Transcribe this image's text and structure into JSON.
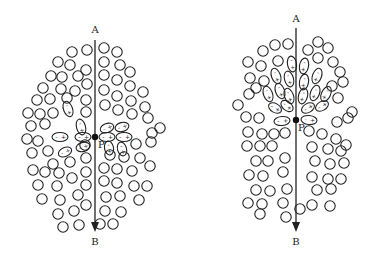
{
  "diagrams": [
    {
      "id": "left",
      "description": "Molecules polarized horizontally near point P on line AB",
      "axis": {
        "x": 95,
        "top_y": 40,
        "bottom_y": 232,
        "top_label": "A",
        "bottom_label": "B",
        "label_top_y": 33,
        "label_bottom_y": 245
      },
      "point": {
        "x": 95,
        "y": 137,
        "label": "P",
        "label_x": 98,
        "label_y": 148
      },
      "circles": [
        [
          72,
          52
        ],
        [
          87,
          50
        ],
        [
          58,
          62
        ],
        [
          70,
          65
        ],
        [
          86,
          70
        ],
        [
          51,
          76
        ],
        [
          62,
          77
        ],
        [
          78,
          76
        ],
        [
          87,
          84
        ],
        [
          43,
          88
        ],
        [
          61,
          89
        ],
        [
          75,
          91
        ],
        [
          37,
          100
        ],
        [
          50,
          99
        ],
        [
          67,
          98
        ],
        [
          86,
          100
        ],
        [
          28,
          113
        ],
        [
          40,
          114
        ],
        [
          53,
          113
        ],
        [
          86,
          112
        ],
        [
          31,
          126
        ],
        [
          45,
          124
        ],
        [
          27,
          139
        ],
        [
          38,
          141
        ],
        [
          32,
          153
        ],
        [
          48,
          151
        ],
        [
          53,
          164
        ],
        [
          33,
          170
        ],
        [
          45,
          172
        ],
        [
          59,
          173
        ],
        [
          70,
          162
        ],
        [
          38,
          185
        ],
        [
          57,
          186
        ],
        [
          72,
          178
        ],
        [
          42,
          199
        ],
        [
          60,
          200
        ],
        [
          78,
          195
        ],
        [
          58,
          214
        ],
        [
          74,
          211
        ],
        [
          86,
          205
        ],
        [
          63,
          227
        ],
        [
          79,
          225
        ],
        [
          86,
          185
        ],
        [
          86,
          172
        ],
        [
          86,
          158
        ],
        [
          85,
          145
        ],
        [
          104,
          48
        ],
        [
          117,
          52
        ],
        [
          104,
          62
        ],
        [
          120,
          65
        ],
        [
          130,
          72
        ],
        [
          104,
          75
        ],
        [
          117,
          80
        ],
        [
          130,
          86
        ],
        [
          143,
          92
        ],
        [
          104,
          90
        ],
        [
          117,
          96
        ],
        [
          131,
          101
        ],
        [
          145,
          107
        ],
        [
          105,
          105
        ],
        [
          118,
          110
        ],
        [
          132,
          114
        ],
        [
          148,
          118
        ],
        [
          152,
          133
        ],
        [
          160,
          128
        ],
        [
          151,
          142
        ],
        [
          136,
          144
        ],
        [
          110,
          155
        ],
        [
          124,
          157
        ],
        [
          140,
          158
        ],
        [
          150,
          166
        ],
        [
          104,
          168
        ],
        [
          117,
          169
        ],
        [
          132,
          171
        ],
        [
          104,
          181
        ],
        [
          117,
          183
        ],
        [
          134,
          186
        ],
        [
          147,
          186
        ],
        [
          106,
          197
        ],
        [
          120,
          196
        ],
        [
          139,
          200
        ],
        [
          105,
          211
        ],
        [
          121,
          212
        ],
        [
          100,
          224
        ],
        [
          113,
          224
        ]
      ],
      "ellipses": [
        {
          "cx": 68,
          "cy": 109,
          "rx": 4.5,
          "ry": 8,
          "rot": -20,
          "sign_pos": "+",
          "sign_neg": "-"
        },
        {
          "cx": 81,
          "cy": 127,
          "rx": 4.5,
          "ry": 8,
          "rot": -15,
          "sign_pos": "+",
          "sign_neg": "-"
        },
        {
          "cx": 60,
          "cy": 137,
          "rx": 8,
          "ry": 4.5,
          "rot": 0,
          "sign_pos": "+",
          "sign_neg": "-"
        },
        {
          "cx": 83,
          "cy": 137,
          "rx": 8,
          "ry": 4.5,
          "rot": 0,
          "sign_pos": "+",
          "sign_neg": "-"
        },
        {
          "cx": 83,
          "cy": 147,
          "rx": 7,
          "ry": 4.5,
          "rot": -15,
          "sign_pos": "+",
          "sign_neg": "-"
        },
        {
          "cx": 65,
          "cy": 152,
          "rx": 7,
          "ry": 4.5,
          "rot": -25,
          "sign_pos": "+",
          "sign_neg": "-"
        },
        {
          "cx": 107,
          "cy": 128,
          "rx": 7,
          "ry": 4.5,
          "rot": -20,
          "sign_pos": "+",
          "sign_neg": "-"
        },
        {
          "cx": 122,
          "cy": 127,
          "rx": 7,
          "ry": 4.5,
          "rot": -15,
          "sign_pos": "+",
          "sign_neg": "-"
        },
        {
          "cx": 107,
          "cy": 137,
          "rx": 8,
          "ry": 4.5,
          "rot": 0,
          "sign_pos": "+",
          "sign_neg": "-"
        },
        {
          "cx": 124,
          "cy": 137,
          "rx": 8,
          "ry": 4.5,
          "rot": 0,
          "sign_pos": "+",
          "sign_neg": "-"
        },
        {
          "cx": 109,
          "cy": 148,
          "rx": 4.5,
          "ry": 7,
          "rot": -10,
          "sign_pos": "+",
          "sign_neg": "-"
        },
        {
          "cx": 122,
          "cy": 149,
          "rx": 4.5,
          "ry": 7,
          "rot": -15,
          "sign_pos": "+",
          "sign_neg": "-"
        }
      ]
    },
    {
      "id": "right",
      "description": "Molecules polarized along the vertical line above point P",
      "axis": {
        "x": 296,
        "top_y": 28,
        "bottom_y": 232,
        "top_label": "A",
        "bottom_label": "B",
        "label_top_y": 22,
        "label_bottom_y": 245
      },
      "point": {
        "x": 296,
        "y": 120,
        "label": "P",
        "label_x": 298,
        "label_y": 131
      },
      "circles": [
        [
          263,
          51
        ],
        [
          275,
          45
        ],
        [
          288,
          44
        ],
        [
          308,
          50
        ],
        [
          318,
          42
        ],
        [
          328,
          48
        ],
        [
          248,
          62
        ],
        [
          261,
          66
        ],
        [
          278,
          61
        ],
        [
          318,
          58
        ],
        [
          333,
          62
        ],
        [
          250,
          78
        ],
        [
          264,
          81
        ],
        [
          340,
          72
        ],
        [
          332,
          86
        ],
        [
          343,
          82
        ],
        [
          249,
          94
        ],
        [
          256,
          88
        ],
        [
          338,
          98
        ],
        [
          238,
          105
        ],
        [
          352,
          112
        ],
        [
          246,
          117
        ],
        [
          259,
          118
        ],
        [
          337,
          122
        ],
        [
          348,
          118
        ],
        [
          248,
          132
        ],
        [
          262,
          134
        ],
        [
          274,
          134
        ],
        [
          285,
          133
        ],
        [
          309,
          131
        ],
        [
          322,
          134
        ],
        [
          336,
          139
        ],
        [
          247,
          146
        ],
        [
          260,
          146
        ],
        [
          272,
          146
        ],
        [
          312,
          147
        ],
        [
          328,
          149
        ],
        [
          341,
          151
        ],
        [
          346,
          145
        ],
        [
          256,
          161
        ],
        [
          268,
          161
        ],
        [
          285,
          158
        ],
        [
          315,
          161
        ],
        [
          330,
          164
        ],
        [
          344,
          163
        ],
        [
          249,
          175
        ],
        [
          263,
          176
        ],
        [
          283,
          172
        ],
        [
          312,
          177
        ],
        [
          328,
          179
        ],
        [
          341,
          179
        ],
        [
          256,
          190
        ],
        [
          270,
          191
        ],
        [
          287,
          189
        ],
        [
          317,
          190
        ],
        [
          331,
          189
        ],
        [
          248,
          203
        ],
        [
          262,
          204
        ],
        [
          283,
          203
        ],
        [
          300,
          209
        ],
        [
          312,
          205
        ],
        [
          330,
          206
        ],
        [
          260,
          214
        ],
        [
          286,
          217
        ]
      ],
      "ellipses": [
        {
          "cx": 292,
          "cy": 64,
          "rx": 4.5,
          "ry": 8,
          "rot": -10,
          "sign_pos": "+",
          "sign_neg": "-"
        },
        {
          "cx": 304,
          "cy": 66,
          "rx": 4.5,
          "ry": 8,
          "rot": 10,
          "sign_pos": "+",
          "sign_neg": "-"
        },
        {
          "cx": 276,
          "cy": 76,
          "rx": 4.5,
          "ry": 8,
          "rot": -20,
          "sign_pos": "+",
          "sign_neg": "-"
        },
        {
          "cx": 289,
          "cy": 79,
          "rx": 4.5,
          "ry": 8,
          "rot": -15,
          "sign_pos": "+",
          "sign_neg": "-"
        },
        {
          "cx": 304,
          "cy": 82,
          "rx": 4.5,
          "ry": 8,
          "rot": 10,
          "sign_pos": "+",
          "sign_neg": "-"
        },
        {
          "cx": 317,
          "cy": 76,
          "rx": 4.5,
          "ry": 8,
          "rot": 20,
          "sign_pos": "+",
          "sign_neg": "-"
        },
        {
          "cx": 268,
          "cy": 94,
          "rx": 4.5,
          "ry": 8,
          "rot": -20,
          "sign_pos": "+",
          "sign_neg": "-"
        },
        {
          "cx": 280,
          "cy": 91,
          "rx": 4.5,
          "ry": 8,
          "rot": -20,
          "sign_pos": "+",
          "sign_neg": "-"
        },
        {
          "cx": 289,
          "cy": 96,
          "rx": 4.5,
          "ry": 8,
          "rot": -20,
          "sign_pos": "+",
          "sign_neg": "-"
        },
        {
          "cx": 303,
          "cy": 96,
          "rx": 4.5,
          "ry": 8,
          "rot": 15,
          "sign_pos": "+",
          "sign_neg": "-"
        },
        {
          "cx": 315,
          "cy": 93,
          "rx": 4.5,
          "ry": 8,
          "rot": 20,
          "sign_pos": "+",
          "sign_neg": "-"
        },
        {
          "cx": 326,
          "cy": 94,
          "rx": 4.5,
          "ry": 8,
          "rot": 25,
          "sign_pos": "+",
          "sign_neg": "-"
        },
        {
          "cx": 275,
          "cy": 108,
          "rx": 7,
          "ry": 4.5,
          "rot": 30,
          "sign_pos": "+",
          "sign_neg": "-"
        },
        {
          "cx": 287,
          "cy": 106,
          "rx": 7,
          "ry": 4.5,
          "rot": 40,
          "sign_pos": "+",
          "sign_neg": "-"
        },
        {
          "cx": 308,
          "cy": 108,
          "rx": 7,
          "ry": 4.5,
          "rot": -30,
          "sign_pos": "+",
          "sign_neg": "-"
        },
        {
          "cx": 322,
          "cy": 106,
          "rx": 7,
          "ry": 4.5,
          "rot": -30,
          "sign_pos": "+",
          "sign_neg": "-"
        },
        {
          "cx": 282,
          "cy": 121,
          "rx": 8,
          "ry": 4.5,
          "rot": -5,
          "sign_pos": "+",
          "sign_neg": "-"
        },
        {
          "cx": 309,
          "cy": 120,
          "rx": 8,
          "ry": 4.5,
          "rot": 5,
          "sign_pos": "+",
          "sign_neg": "-"
        }
      ]
    }
  ],
  "style": {
    "stroke_color": "#222222",
    "background": "#ffffff",
    "circle_radius": 5.2
  }
}
